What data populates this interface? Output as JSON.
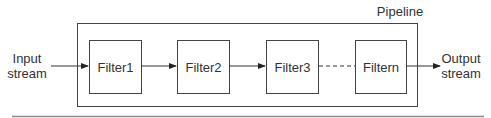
{
  "diagram": {
    "title": "Pipeline",
    "input_label_line1": "Input",
    "input_label_line2": "stream",
    "output_label_line1": "Output",
    "output_label_line2": "stream",
    "filters": [
      {
        "label": "Filter1"
      },
      {
        "label": "Filter2"
      },
      {
        "label": "Filter3"
      },
      {
        "label": "Filtern"
      }
    ],
    "connections": [
      {
        "from": "Input stream",
        "to": "Filter1",
        "style": "solid-arrow"
      },
      {
        "from": "Filter1",
        "to": "Filter2",
        "style": "solid-arrow"
      },
      {
        "from": "Filter2",
        "to": "Filter3",
        "style": "solid-arrow"
      },
      {
        "from": "Filter3",
        "to": "Filtern",
        "style": "dashed"
      },
      {
        "from": "Filtern",
        "to": "Output stream",
        "style": "solid-arrow"
      }
    ],
    "colors": {
      "stroke": "#444444",
      "text": "#333333",
      "background": "#ffffff"
    }
  }
}
